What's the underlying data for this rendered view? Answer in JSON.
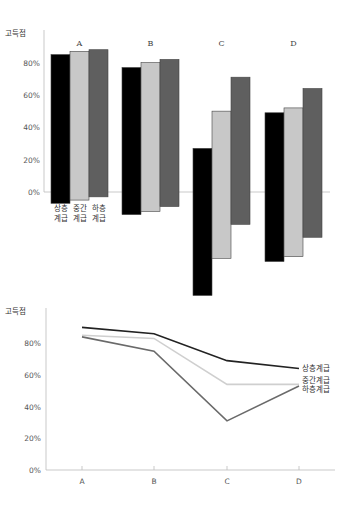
{
  "chart_data": [
    {
      "type": "bar",
      "subtype": "floating-range-bar",
      "title": "",
      "ylabel": "고득점",
      "xlabel": "",
      "categories": [
        "A",
        "B",
        "C",
        "D"
      ],
      "yticks": [
        "80%",
        "60%",
        "40%",
        "20%",
        "0%"
      ],
      "ylim": [
        -65,
        90
      ],
      "grid": false,
      "legend_position": "below first group (A)",
      "series_labels": [
        [
          "상층",
          "계급"
        ],
        [
          "중간",
          "계급"
        ],
        [
          "하층",
          "계급"
        ]
      ],
      "series": [
        {
          "name": "상층계급",
          "color": "#000000",
          "top": [
            85,
            77,
            27,
            49
          ],
          "bottom": [
            -7,
            -14,
            -64,
            -43
          ]
        },
        {
          "name": "중간계급",
          "color": "#c8c8c8",
          "top": [
            87,
            80,
            50,
            52
          ],
          "bottom": [
            -5,
            -12,
            -41,
            -40
          ]
        },
        {
          "name": "하층계급",
          "color": "#5f5f5f",
          "top": [
            88,
            82,
            71,
            64
          ],
          "bottom": [
            -3,
            -9,
            -20,
            -28
          ]
        }
      ]
    },
    {
      "type": "line",
      "title": "",
      "ylabel": "고득점",
      "xlabel": "",
      "categories": [
        "A",
        "B",
        "C",
        "D"
      ],
      "yticks": [
        "80%",
        "60%",
        "40%",
        "20%",
        "0%"
      ],
      "ylim": [
        0,
        95
      ],
      "grid": false,
      "legend_position": "right end of lines (direct labels)",
      "series": [
        {
          "name": "상층계급",
          "color": "#222222",
          "values": [
            90,
            86,
            69,
            64
          ]
        },
        {
          "name": "중간계급",
          "color": "#cfcfcf",
          "values": [
            85,
            83,
            54,
            54
          ]
        },
        {
          "name": "하층계급",
          "color": "#6a6a6a",
          "values": [
            84,
            75,
            31,
            53
          ]
        }
      ]
    }
  ]
}
